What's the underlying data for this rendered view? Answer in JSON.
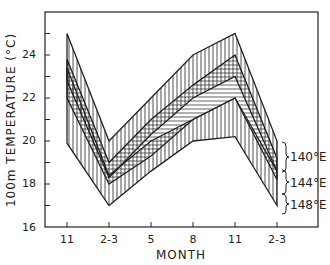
{
  "chart_data": {
    "type": "area",
    "title": "",
    "xlabel": "MONTH",
    "ylabel": "100m TEMPERATURE (°C)",
    "categories": [
      "11",
      "2-3",
      "5",
      "8",
      "11",
      "2-3"
    ],
    "ylim": [
      16,
      26
    ],
    "yticks": [
      16,
      18,
      20,
      22,
      24
    ],
    "grid": false,
    "legend": [
      "140°E",
      "144°E",
      "148°E"
    ],
    "legend_position": "right, bracketed",
    "series": [
      {
        "name": "140°E",
        "hatch": "vertical",
        "upper": [
          25,
          20,
          22,
          24,
          25,
          20
        ],
        "lower": [
          22.8,
          18.3,
          20.3,
          22,
          23,
          18.6
        ]
      },
      {
        "name": "144°E",
        "hatch": "horizontal",
        "upper": [
          23.8,
          19,
          21,
          22.6,
          24,
          19.2
        ],
        "lower": [
          22,
          18,
          19.3,
          21,
          22,
          18.2
        ]
      },
      {
        "name": "148°E",
        "hatch": "vertical",
        "upper": [
          23.4,
          18.4,
          20,
          21,
          22,
          18.6
        ],
        "lower": [
          19.9,
          17,
          18.6,
          20,
          20.2,
          17
        ]
      }
    ]
  },
  "labels": {
    "xlabel": "MONTH",
    "ylabel": "100m  TEMPERATURE  (°C)",
    "xticks": [
      "11",
      "2-3",
      "5",
      "8",
      "11",
      "2-3"
    ],
    "yticks": [
      "24",
      "22",
      "20",
      "18",
      "16"
    ],
    "legend": [
      "140°E",
      "144°E",
      "148°E"
    ]
  }
}
